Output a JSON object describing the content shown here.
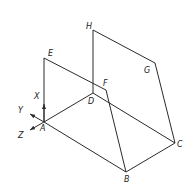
{
  "diagram": {
    "type": "isometric-solid",
    "line_color": "#2b2b2b",
    "background": "#ffffff",
    "vertices": {
      "A": {
        "label": "A",
        "x": 44,
        "y": 122
      },
      "B": {
        "label": "B",
        "x": 126,
        "y": 172
      },
      "C": {
        "label": "C",
        "x": 175,
        "y": 143
      },
      "D": {
        "label": "D",
        "x": 93,
        "y": 93
      },
      "E": {
        "label": "E",
        "x": 44,
        "y": 58
      },
      "F": {
        "label": "F",
        "x": 104,
        "y": 89
      },
      "G": {
        "label": "G",
        "x": 154,
        "y": 63
      },
      "H": {
        "label": "H",
        "x": 93,
        "y": 30
      }
    },
    "edges": [
      [
        "A",
        "E"
      ],
      [
        "E",
        "F"
      ],
      [
        "F",
        "B"
      ],
      [
        "A",
        "B"
      ],
      [
        "A",
        "D"
      ],
      [
        "D",
        "C"
      ],
      [
        "B",
        "C"
      ],
      [
        "D",
        "H"
      ],
      [
        "H",
        "G"
      ],
      [
        "G",
        "C"
      ]
    ],
    "axes": {
      "x": {
        "label": "X"
      },
      "y": {
        "label": "Y"
      },
      "z": {
        "label": "Z"
      }
    }
  }
}
